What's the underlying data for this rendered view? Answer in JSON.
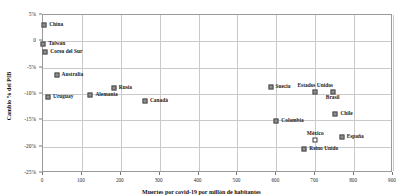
{
  "chart_data": {
    "type": "scatter",
    "title": "",
    "xlabel": "Muertes por covid-19 por millón de habitantes",
    "ylabel": "Cambio % del PIB",
    "xlim": [
      0,
      900
    ],
    "ylim": [
      -25,
      5
    ],
    "grid": true,
    "legend": "none",
    "xticks": [
      "0",
      "100",
      "200",
      "300",
      "400",
      "500",
      "600",
      "700",
      "800",
      "900"
    ],
    "xtick_values": [
      0,
      100,
      200,
      300,
      400,
      500,
      600,
      700,
      800,
      900
    ],
    "yticks": [
      "5%",
      "0",
      "-5%",
      "-10%",
      "-15%",
      "-20%",
      "-25%"
    ],
    "ytick_values": [
      5,
      0,
      -5,
      -10,
      -15,
      -20,
      -25
    ],
    "marker": "square",
    "marker_color": "#8f8f8f",
    "marker_edge_color": "#4a4a4a",
    "points": [
      {
        "label": "China",
        "x": 3,
        "y": 3.1,
        "label_pos": "right",
        "hollow": false
      },
      {
        "label": "Taiwan",
        "x": 1,
        "y": -0.5,
        "label_pos": "right",
        "hollow": false
      },
      {
        "label": "Corea del Sur",
        "x": 6,
        "y": -2.1,
        "label_pos": "right",
        "hollow": false
      },
      {
        "label": "Australia",
        "x": 35,
        "y": -6.4,
        "label_pos": "right",
        "hollow": false
      },
      {
        "label": "Uruguay",
        "x": 13,
        "y": -10.5,
        "label_pos": "right",
        "hollow": false
      },
      {
        "label": "Alemania",
        "x": 122,
        "y": -10.1,
        "label_pos": "right",
        "hollow": false
      },
      {
        "label": "Rusia",
        "x": 182,
        "y": -8.8,
        "label_pos": "right",
        "hollow": false
      },
      {
        "label": "Canadá",
        "x": 262,
        "y": -11.3,
        "label_pos": "right",
        "hollow": false
      },
      {
        "label": "Suecia",
        "x": 585,
        "y": -8.7,
        "label_pos": "right",
        "hollow": false
      },
      {
        "label": "Estados Unidos",
        "x": 700,
        "y": -9.7,
        "label_pos": "above",
        "hollow": false
      },
      {
        "label": "Brasil",
        "x": 745,
        "y": -9.7,
        "label_pos": "below",
        "hollow": false
      },
      {
        "label": "Chile",
        "x": 752,
        "y": -13.8,
        "label_pos": "right",
        "hollow": false
      },
      {
        "label": "Colombia",
        "x": 600,
        "y": -15.2,
        "label_pos": "right",
        "hollow": false
      },
      {
        "label": "México",
        "x": 700,
        "y": -18.7,
        "label_pos": "above",
        "hollow": true
      },
      {
        "label": "España",
        "x": 768,
        "y": -18.2,
        "label_pos": "right",
        "hollow": false
      },
      {
        "label": "Reino Unido",
        "x": 672,
        "y": -20.4,
        "label_pos": "right",
        "hollow": false
      }
    ]
  }
}
